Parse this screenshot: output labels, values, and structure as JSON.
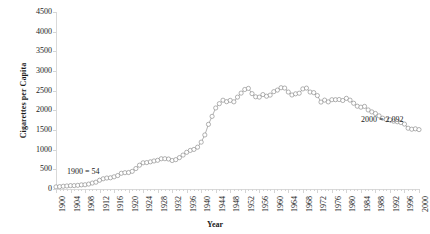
{
  "chart_data": {
    "type": "line",
    "title": "",
    "xlabel": "Year",
    "ylabel": "Cigarettes per Capita",
    "xlim": [
      1900,
      2000
    ],
    "ylim": [
      0,
      4500
    ],
    "ytick_step": 500,
    "xtick_step": 4,
    "grid": false,
    "legend": "none",
    "marker": "open-circle",
    "line_color": "#808080",
    "marker_color": "#ffffff",
    "marker_edge_color": "#808080",
    "axis_color": "#d9d9d9",
    "ytick_labels": [
      "0",
      "500",
      "1000",
      "1500",
      "2000",
      "2500",
      "3000",
      "3500",
      "4000",
      "4500"
    ],
    "xtick_labels": [
      "1900",
      "1904",
      "1908",
      "1912",
      "1916",
      "1920",
      "1924",
      "1928",
      "1932",
      "1936",
      "1940",
      "1944",
      "1948",
      "1952",
      "1956",
      "1960",
      "1964",
      "1968",
      "1972",
      "1976",
      "1980",
      "1984",
      "1988",
      "1992",
      "1996",
      "2000"
    ],
    "annotations": [
      {
        "text": "1900 = 54",
        "x": 1903,
        "y": 430
      },
      {
        "text": "2000 = 2,092",
        "x": 1984,
        "y": 1750
      }
    ],
    "x": [
      1900,
      1901,
      1902,
      1903,
      1904,
      1905,
      1906,
      1907,
      1908,
      1909,
      1910,
      1911,
      1912,
      1913,
      1914,
      1915,
      1916,
      1917,
      1918,
      1919,
      1920,
      1921,
      1922,
      1923,
      1924,
      1925,
      1926,
      1927,
      1928,
      1929,
      1930,
      1931,
      1932,
      1933,
      1934,
      1935,
      1936,
      1937,
      1938,
      1939,
      1940,
      1941,
      1942,
      1943,
      1944,
      1945,
      1946,
      1947,
      1948,
      1949,
      1950,
      1951,
      1952,
      1953,
      1954,
      1955,
      1956,
      1957,
      1958,
      1959,
      1960,
      1961,
      1962,
      1963,
      1964,
      1965,
      1966,
      1967,
      1968,
      1969,
      1970,
      1971,
      1972,
      1973,
      1974,
      1975,
      1976,
      1977,
      1978,
      1979,
      1980,
      1981,
      1982,
      1983,
      1984,
      1985,
      1986,
      1987,
      1988,
      1989,
      1990,
      1991,
      1992,
      1993,
      1994,
      1995,
      1996,
      1997,
      1998,
      1999,
      2000
    ],
    "y": [
      54,
      60,
      70,
      77,
      86,
      86,
      93,
      105,
      108,
      125,
      151,
      173,
      223,
      260,
      279,
      285,
      310,
      342,
      400,
      415,
      419,
      449,
      520,
      605,
      666,
      672,
      691,
      713,
      730,
      769,
      770,
      762,
      724,
      746,
      798,
      863,
      933,
      981,
      1006,
      1064,
      1191,
      1374,
      1644,
      1847,
      2060,
      2170,
      2257,
      2220,
      2253,
      2216,
      2336,
      2438,
      2530,
      2558,
      2425,
      2344,
      2336,
      2401,
      2359,
      2387,
      2475,
      2515,
      2575,
      2566,
      2465,
      2390,
      2420,
      2435,
      2545,
      2565,
      2465,
      2450,
      2375,
      2210,
      2260,
      2215,
      2270,
      2270,
      2275,
      2250,
      2305,
      2260,
      2180,
      2105,
      2080,
      2100,
      2010,
      1960,
      1920,
      1860,
      1800,
      1765,
      1760,
      1725,
      1710,
      1690,
      1650,
      1545,
      1520,
      1530,
      1510,
      1445,
      2092
    ]
  }
}
